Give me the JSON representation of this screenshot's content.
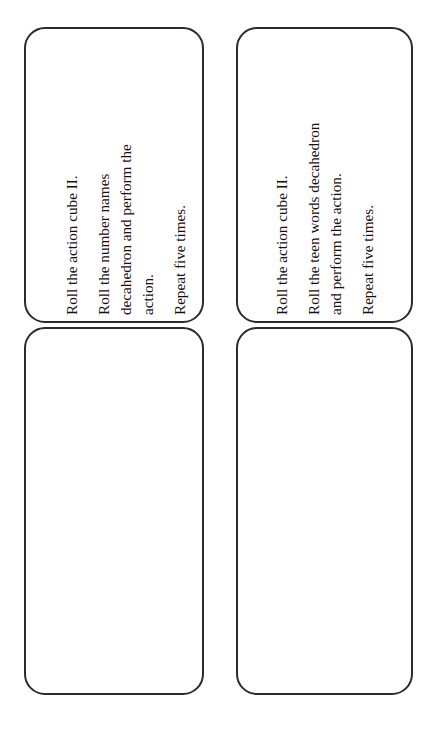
{
  "page": {
    "background_color": "#ffffff",
    "width": 435,
    "height": 730,
    "text_rotation": "-90deg (reads bottom-to-top)"
  },
  "style": {
    "card_border_color": "#2b2b2b",
    "card_fill_color": "#ffffff",
    "text_color": "#111111",
    "disc_fill_color": "#8e8e8e",
    "disc_rim_color": "#4b4b4b"
  },
  "cards": [
    {
      "id": "instruction-card-number-names",
      "type": "instructions",
      "position": "top-left",
      "lines": [
        "Roll the action cube II.",
        "Roll the number names",
        "decahedron and perform the",
        "action.",
        "Repeat five times."
      ]
    },
    {
      "id": "instruction-card-teen-words",
      "type": "instructions",
      "position": "top-right",
      "lines": [
        "Roll the action cube II.",
        "Roll the teen words decahedron",
        "and perform the action.",
        "Repeat five times."
      ]
    },
    {
      "id": "counter-card-three",
      "type": "counters",
      "position": "bottom-left",
      "count": 3,
      "arrangement": "column",
      "counter_label": "gray disc counter"
    },
    {
      "id": "counter-card-four",
      "type": "counters",
      "position": "bottom-right",
      "count": 4,
      "arrangement": "two-by-two grid",
      "counter_label": "gray disc counter"
    }
  ]
}
